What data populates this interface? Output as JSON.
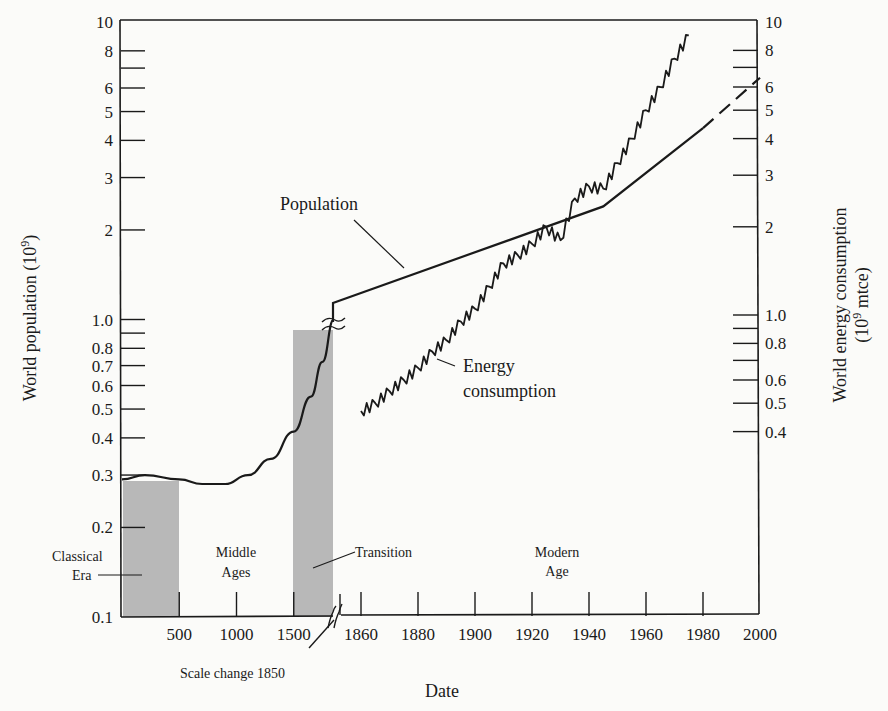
{
  "chart_data": {
    "type": "line",
    "title": "",
    "xlabel": "Date",
    "ylabel_left": "World population (10^9)",
    "ylabel_right": "World energy consumption (10^9 mtce)",
    "yscale": "log",
    "ylim_left": [
      0.1,
      10
    ],
    "ylim_right": [
      0.4,
      10
    ],
    "grid": false,
    "x_tick_labels": [
      "500",
      "1000",
      "1500",
      "1860",
      "1880",
      "1900",
      "1920",
      "1940",
      "1960",
      "1980",
      "2000"
    ],
    "x_scale_break": {
      "year": 1850,
      "label": "Scale change 1850"
    },
    "y_left_tick_labels": [
      "10",
      "8",
      "6",
      "5",
      "4",
      "3",
      "2",
      "1.0",
      "0.8",
      "0.7",
      "0.6",
      "0.5",
      "0.4",
      "0.3",
      "0.2",
      "0.1"
    ],
    "y_right_tick_labels": [
      "10",
      "8",
      "6",
      "5",
      "4",
      "3",
      "2",
      "1.0",
      "0.8",
      "0.6",
      "0.5",
      "0.4"
    ],
    "eras": [
      {
        "name": "Classical Era",
        "start": 0,
        "end": 500,
        "shaded": true
      },
      {
        "name": "Middle Ages",
        "start": 500,
        "end": 1500,
        "shaded": false
      },
      {
        "name": "Transition",
        "start": 1500,
        "end": 1850,
        "shaded": true
      },
      {
        "name": "Modern Age",
        "start": 1850,
        "end": 2000,
        "shaded": false
      }
    ],
    "series": [
      {
        "name": "Population",
        "axis": "left",
        "x": [
          0,
          200,
          500,
          700,
          900,
          1100,
          1300,
          1500,
          1650,
          1750,
          1850,
          1945,
          1980,
          2000
        ],
        "values": [
          0.29,
          0.3,
          0.29,
          0.28,
          0.28,
          0.3,
          0.34,
          0.42,
          0.55,
          0.72,
          1.0,
          2.4,
          4.4,
          6.5
        ],
        "note": "dashed projection 1980-2000"
      },
      {
        "name": "Energy consumption",
        "axis": "right",
        "x": [
          1860,
          1865,
          1870,
          1875,
          1880,
          1885,
          1890,
          1895,
          1900,
          1905,
          1910,
          1915,
          1920,
          1925,
          1930,
          1935,
          1940,
          1945,
          1950,
          1955,
          1960,
          1965,
          1970,
          1975
        ],
        "values": [
          0.47,
          0.5,
          0.55,
          0.6,
          0.66,
          0.75,
          0.82,
          0.95,
          1.05,
          1.25,
          1.5,
          1.6,
          1.75,
          2.0,
          1.8,
          2.5,
          2.75,
          2.7,
          3.3,
          4.0,
          5.0,
          6.0,
          7.5,
          9.0
        ]
      }
    ]
  },
  "labels": {
    "x_axis_title": "Date",
    "y_left_title": "World population (10",
    "y_left_title_sup": "9",
    "y_left_title_end": ")",
    "y_right_title_line1": "World energy consumption",
    "y_right_title_line2_a": "(10",
    "y_right_title_line2_sup": "9",
    "y_right_title_line2_b": " mtce)",
    "population": "Population",
    "energy_line1": "Energy",
    "energy_line2": "consumption",
    "classical_line1": "Classical",
    "classical_line2": "Era",
    "middle_line1": "Middle",
    "middle_line2": "Ages",
    "transition": "Transition",
    "modern_line1": "Modern",
    "modern_line2": "Age",
    "scale_change": "Scale change 1850"
  },
  "colors": {
    "ink": "#1a1a1a",
    "shade": "#b8b8b8",
    "paper": "#fbfbf9"
  }
}
